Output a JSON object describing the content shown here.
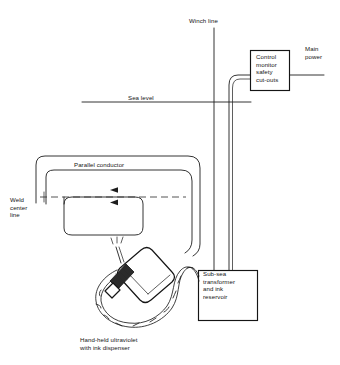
{
  "diagram": {
    "ink_color": "#1d1d1d",
    "background_color": "#ffffff",
    "labels": {
      "winch_line": "Winch line",
      "sea_level": "Sea level",
      "main_power": "Main\npower",
      "parallel_conductor": "Parallel conductor",
      "weld_center_line": "Weld\ncenter\nline",
      "hand_held": "Hand-held ultraviolet\nwith ink dispenser"
    },
    "boxes": {
      "control_unit": {
        "name": "control-monitor-box",
        "text": "Control\nmonitor\nsafety\ncut-outs"
      },
      "subsea_unit": {
        "name": "sub-sea-transformer-box",
        "text": "Sub-sea\ntransformer\nand ink\nreservoir"
      }
    },
    "components": [
      "winch-line",
      "sea-level-line",
      "control-monitor-box",
      "main-power-lead",
      "parallel-conductor-outer-loop",
      "parallel-conductor-inner-loop",
      "lower-conductor-loop",
      "weld-center-dashed-line",
      "current-direction-arrows",
      "umbilical-cable",
      "hand-held-uv-ink-dispenser",
      "sub-sea-transformer-box"
    ]
  }
}
